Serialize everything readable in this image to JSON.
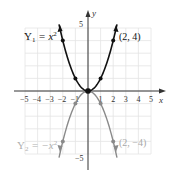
{
  "chart_data": {
    "type": "line",
    "title": "",
    "xlabel": "x",
    "ylabel": "y",
    "xlim": [
      -5,
      5
    ],
    "ylim": [
      -5,
      5
    ],
    "grid": true,
    "x_ticks": [
      -5,
      -4,
      -3,
      -2,
      -1,
      1,
      2,
      3,
      4,
      5
    ],
    "y_ticks": [
      5,
      -5
    ],
    "series": [
      {
        "name": "Y1 = x^2",
        "label": "Y₁ = x²",
        "color": "#111111",
        "x": [
          -2,
          -1,
          0,
          1,
          2
        ],
        "y": [
          4,
          1,
          0,
          1,
          4
        ],
        "annotation": "(2, 4)"
      },
      {
        "name": "Y2 = -x^2",
        "label": "Y₂ = −x²",
        "color": "#8a8a8a",
        "x": [
          -2,
          -1,
          0,
          1,
          2
        ],
        "y": [
          -4,
          -1,
          0,
          -1,
          -4
        ],
        "annotation": "(2, −4)"
      }
    ]
  },
  "labels": {
    "x_axis": "x",
    "y_axis": "y",
    "y_top": "5",
    "y_bottom": "−5",
    "x_ticks": [
      "−5",
      "−4",
      "−3",
      "−2",
      "−1",
      "1",
      "2",
      "3",
      "4",
      "5"
    ],
    "y1_label": "Y",
    "y1_sub": "1",
    "y1_rest": " = x",
    "y1_sup": "2",
    "y2_label": "Y",
    "y2_sub": "2",
    "y2_rest": " = −x",
    "y2_sup": "2",
    "point1": "(2, 4)",
    "point2": "(2, −4)"
  }
}
